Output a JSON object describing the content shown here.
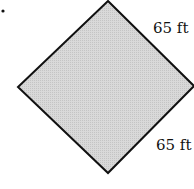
{
  "figure": {
    "shape": "square rotated 45 degrees (diamond)",
    "fill_color": "#d6d6d6",
    "stroke_color": "#111111",
    "bullet": "•",
    "labels": {
      "upper_right_side": "65 ft",
      "lower_right_side": "65 ft"
    }
  }
}
